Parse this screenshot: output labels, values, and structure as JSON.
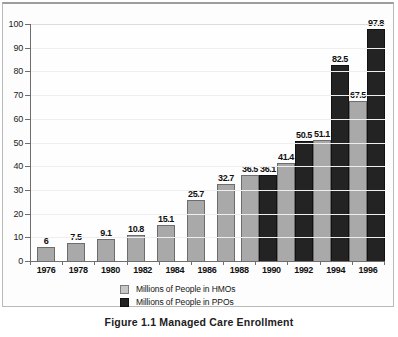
{
  "caption": "Figure 1.1  Managed Care Enrollment",
  "legend": {
    "items": [
      {
        "label": "Millions of People in HMOs",
        "swatch": "light-gray-swatch",
        "color": "#c7c7c7"
      },
      {
        "label": "Millions of People in PPOs",
        "swatch": "dark-swatch",
        "color": "#232323"
      }
    ]
  },
  "chart_data": {
    "type": "bar",
    "title": "Figure 1.1  Managed Care Enrollment",
    "xlabel": "",
    "ylabel": "",
    "ylim": [
      0,
      100
    ],
    "yticks": [
      0,
      10,
      20,
      30,
      40,
      50,
      60,
      70,
      80,
      90,
      100
    ],
    "grid": true,
    "legend_position": "bottom",
    "categories": [
      "1976",
      "1978",
      "1980",
      "1982",
      "1984",
      "1986",
      "1988",
      "1990",
      "1992",
      "1994",
      "1996"
    ],
    "series": [
      {
        "name": "Millions of People in HMOs",
        "color": "#a9a9a9",
        "values": [
          6,
          7.5,
          9.1,
          10.8,
          15.1,
          25.7,
          32.7,
          36.5,
          41.4,
          51.1,
          67.5
        ],
        "labels": [
          "6",
          "7.5",
          "9.1",
          "10.8",
          "15.1",
          "25.7",
          "32.7",
          "36.5",
          "41.4",
          "51.1",
          "67.5"
        ]
      },
      {
        "name": "Millions of People in PPOs",
        "color": "#232323",
        "values": [
          null,
          null,
          null,
          null,
          null,
          null,
          null,
          36.1,
          50.5,
          82.5,
          97.8
        ],
        "labels": [
          "",
          "",
          "",
          "",
          "",
          "",
          "",
          "36.1",
          "50.5",
          "82.5",
          "97.8"
        ]
      }
    ]
  }
}
